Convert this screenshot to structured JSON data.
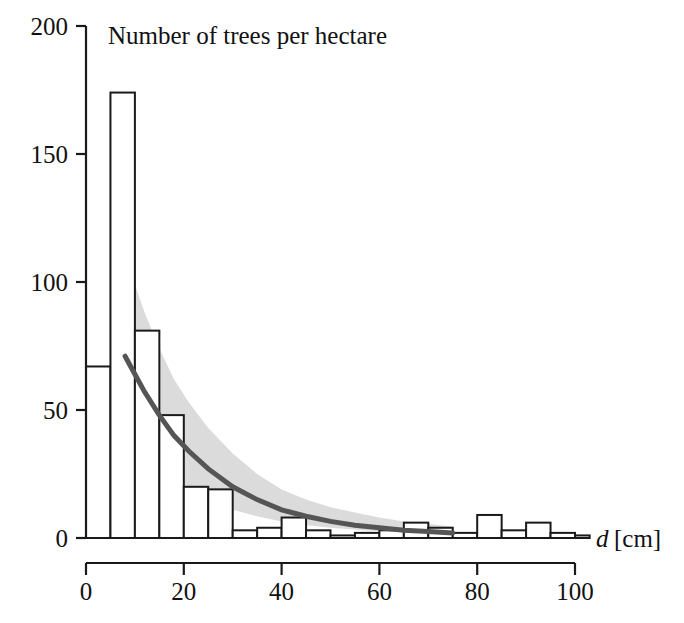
{
  "chart_data": {
    "type": "bar",
    "title": "Number of trees per hectare",
    "xlabel": "d [cm]",
    "xlabel_symbol": "d",
    "xlabel_unit": "[cm]",
    "ylabel": "",
    "xlim": [
      0,
      103
    ],
    "ylim": [
      0,
      200
    ],
    "grid": false,
    "legend": "none",
    "bin_width": 5,
    "x_ticks": [
      0,
      20,
      40,
      60,
      80,
      100
    ],
    "x_tick_labels": [
      "0",
      "20",
      "40",
      "60",
      "80",
      "100"
    ],
    "y_ticks": [
      0,
      50,
      100,
      150,
      200
    ],
    "y_tick_labels": [
      "0",
      "50",
      "100",
      "150",
      "200"
    ],
    "categories": [
      "0-5",
      "5-10",
      "10-15",
      "15-20",
      "20-25",
      "25-30",
      "30-35",
      "35-40",
      "40-45",
      "45-50",
      "50-55",
      "55-60",
      "60-65",
      "65-70",
      "70-75",
      "75-80",
      "80-85",
      "85-90",
      "90-95",
      "95-100",
      "100-103"
    ],
    "bin_starts": [
      0,
      5,
      10,
      15,
      20,
      25,
      30,
      35,
      40,
      45,
      50,
      55,
      60,
      65,
      70,
      75,
      80,
      85,
      90,
      95,
      100
    ],
    "values": [
      67,
      174,
      81,
      48,
      20,
      19,
      3,
      4,
      8,
      3,
      1,
      2,
      3,
      6,
      4,
      2,
      9,
      3,
      6,
      2,
      1
    ],
    "series": [
      {
        "name": "Number of trees per hectare",
        "values": [
          67,
          174,
          81,
          48,
          20,
          19,
          3,
          4,
          8,
          3,
          1,
          2,
          3,
          6,
          4,
          2,
          9,
          3,
          6,
          2,
          1
        ]
      },
      {
        "name": "fitted model curve",
        "type": "line",
        "x": [
          8,
          10,
          12,
          15,
          18,
          21,
          25,
          30,
          35,
          40,
          45,
          50,
          55,
          60,
          65,
          70,
          75
        ],
        "y": [
          71,
          64,
          57,
          48,
          40,
          34,
          27,
          20,
          15,
          11,
          8.5,
          6.5,
          5,
          4,
          3,
          2.5,
          2
        ]
      },
      {
        "name": "confidence band upper",
        "type": "band-upper",
        "x": [
          7,
          8,
          10,
          12,
          15,
          18,
          21,
          25,
          30,
          35,
          40,
          45,
          50,
          55,
          60,
          65,
          70,
          75
        ],
        "y": [
          120,
          112,
          99,
          88,
          74,
          62,
          53,
          43,
          33,
          25,
          19,
          15,
          12,
          10,
          8,
          6.5,
          5.5,
          4.5
        ]
      },
      {
        "name": "confidence band lower",
        "type": "band-lower",
        "x": [
          7,
          8,
          10,
          12,
          15,
          18,
          21,
          25,
          30,
          35,
          40,
          45,
          50,
          55,
          60,
          65,
          70,
          75
        ],
        "y": [
          36,
          34,
          31,
          28,
          24,
          21,
          18,
          15,
          11,
          8.5,
          6.5,
          5,
          4,
          3.2,
          2.6,
          2.1,
          1.7,
          1.4
        ]
      }
    ],
    "colors": {
      "bar_stroke": "#1a1a1a",
      "bar_fill": "#ffffff",
      "curve": "#555555",
      "band": "#d9d9d9",
      "axis": "#1a1a1a",
      "text": "#111111"
    }
  }
}
